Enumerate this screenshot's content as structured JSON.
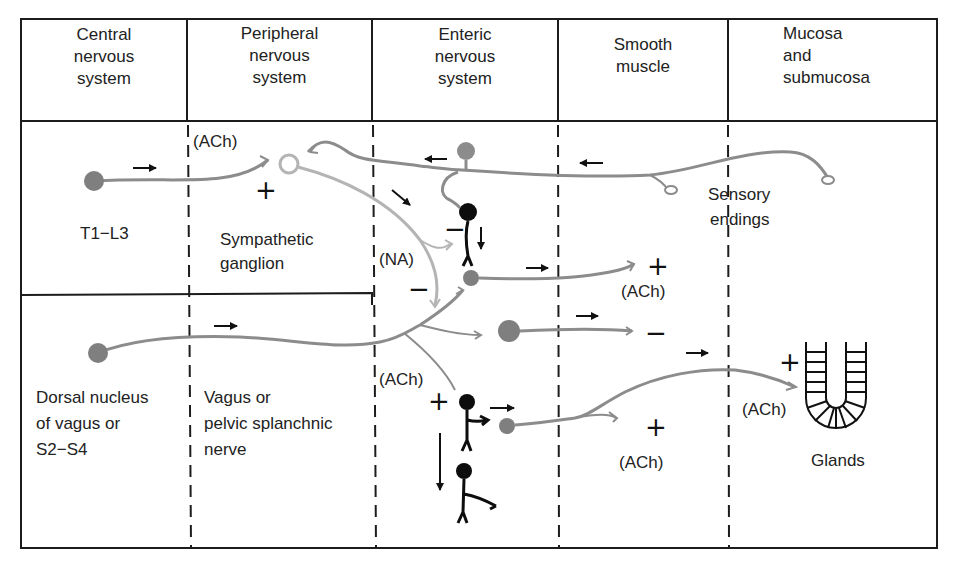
{
  "columns": [
    {
      "id": "cns",
      "label_lines": [
        "Central",
        "nervous",
        "system"
      ]
    },
    {
      "id": "pns",
      "label_lines": [
        "Peripheral",
        "nervous",
        "system"
      ]
    },
    {
      "id": "ens",
      "label_lines": [
        "Enteric",
        "nervous",
        "system"
      ]
    },
    {
      "id": "smooth-muscle",
      "label_lines": [
        "Smooth",
        "muscle"
      ]
    },
    {
      "id": "mucosa",
      "label_lines": [
        "Mucosa",
        "and",
        "submucosa"
      ]
    }
  ],
  "labels": {
    "sympathetic_origin": "T1−L3",
    "sympathetic_ganglion_1": "Sympathetic",
    "sympathetic_ganglion_2": "ganglion",
    "parasym_origin_1": "Dorsal nucleus",
    "parasym_origin_2": "of vagus or",
    "parasym_origin_3": "S2−S4",
    "parasym_nerve_1": "Vagus or",
    "parasym_nerve_2": "pelvic splanchnic",
    "parasym_nerve_3": "nerve",
    "sensory_1": "Sensory",
    "sensory_2": "endings",
    "glands": "Glands"
  },
  "neurotransmitters": {
    "preganglionic_symp": "(ACh)",
    "postganglionic_symp": "(NA)",
    "enteric_muscle_upper": "(ACh)",
    "vagal": "(ACh)",
    "enteric_muscle_lower": "(ACh)",
    "secretomotor": "(ACh)"
  },
  "signs": {
    "ganglion_excite": "+",
    "na_inhibit_interneuron": "−",
    "na_inhibit_lower": "−",
    "muscle_excite_upper": "+",
    "muscle_inhibit": "−",
    "vagal_excite": "+",
    "muscle_excite_lower": "+",
    "gland_excite": "+"
  },
  "colors": {
    "border": "#1c1c1c",
    "nerve_gray": "#8c8c8c",
    "nerve_light": "#b4b4b4",
    "soma_gray": "#7f7f7f",
    "interneuron_black": "#0d0d0d"
  }
}
